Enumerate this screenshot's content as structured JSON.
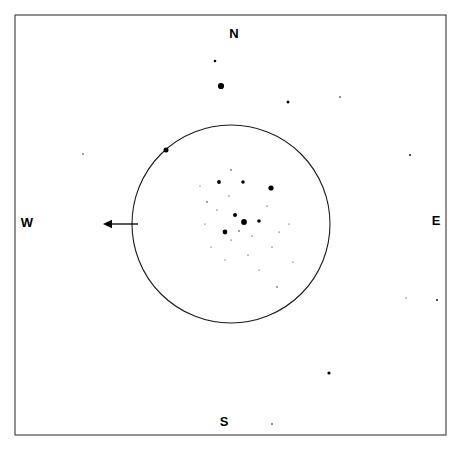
{
  "chart_data": {
    "type": "scatter",
    "title": "",
    "xlabel": "",
    "ylabel": "",
    "xlim": [
      0,
      461
    ],
    "ylim": [
      0,
      450
    ],
    "grid": false,
    "legend": null,
    "frame": {
      "x": 15,
      "y": 15,
      "width": 431,
      "height": 420,
      "stroke": "#3a3a3a"
    },
    "eyepiece_field": {
      "center_x": 231,
      "center_y": 224,
      "radius": 99,
      "stroke": "#1a1a1a"
    },
    "drift_arrow": {
      "tip_x": 103,
      "tip_y": 224,
      "tail_x": 138,
      "tail_y": 224,
      "direction": "west",
      "color": "#000000"
    },
    "cardinal_labels": [
      {
        "text": "N",
        "x": 234,
        "y": 35
      },
      {
        "text": "E",
        "x": 436,
        "y": 222
      },
      {
        "text": "S",
        "x": 224,
        "y": 423
      },
      {
        "text": "W",
        "x": 27,
        "y": 224
      }
    ],
    "star_color": "#000000",
    "stars": [
      {
        "x": 221,
        "y": 86,
        "r": 3.1,
        "region": "outside-north"
      },
      {
        "x": 215,
        "y": 61,
        "r": 1.3,
        "region": "outside-north"
      },
      {
        "x": 288,
        "y": 102,
        "r": 1.5,
        "region": "outside-northeast"
      },
      {
        "x": 340,
        "y": 97,
        "r": 0.8,
        "region": "outside-northeast"
      },
      {
        "x": 410,
        "y": 155,
        "r": 0.9,
        "region": "outside-east"
      },
      {
        "x": 437,
        "y": 300,
        "r": 0.9,
        "region": "outside-east"
      },
      {
        "x": 329,
        "y": 373,
        "r": 1.6,
        "region": "outside-south"
      },
      {
        "x": 272,
        "y": 424,
        "r": 0.8,
        "region": "outside-south"
      },
      {
        "x": 83,
        "y": 154,
        "r": 0.7,
        "region": "outside-west"
      },
      {
        "x": 406,
        "y": 298,
        "r": 0.6,
        "region": "outside-east"
      },
      {
        "x": 166,
        "y": 150,
        "r": 2.5,
        "region": "field-edge"
      },
      {
        "x": 219,
        "y": 182,
        "r": 1.9,
        "region": "cluster"
      },
      {
        "x": 243,
        "y": 182,
        "r": 1.8,
        "region": "cluster"
      },
      {
        "x": 271,
        "y": 188,
        "r": 2.6,
        "region": "cluster"
      },
      {
        "x": 235,
        "y": 215,
        "r": 2.0,
        "region": "cluster-core"
      },
      {
        "x": 244,
        "y": 222,
        "r": 2.9,
        "region": "cluster-core"
      },
      {
        "x": 259,
        "y": 221,
        "r": 1.8,
        "region": "cluster-core"
      },
      {
        "x": 225,
        "y": 232,
        "r": 2.4,
        "region": "cluster-core"
      },
      {
        "x": 231,
        "y": 170,
        "r": 0.7,
        "region": "cluster"
      },
      {
        "x": 207,
        "y": 202,
        "r": 0.7,
        "region": "cluster"
      },
      {
        "x": 229,
        "y": 196,
        "r": 0.6,
        "region": "cluster"
      },
      {
        "x": 217,
        "y": 210,
        "r": 0.6,
        "region": "cluster"
      },
      {
        "x": 239,
        "y": 231,
        "r": 0.7,
        "region": "cluster-core"
      },
      {
        "x": 231,
        "y": 240,
        "r": 0.6,
        "region": "cluster-core"
      },
      {
        "x": 252,
        "y": 236,
        "r": 0.6,
        "region": "cluster-core"
      },
      {
        "x": 267,
        "y": 206,
        "r": 0.6,
        "region": "cluster"
      },
      {
        "x": 205,
        "y": 224,
        "r": 0.5,
        "region": "cluster"
      },
      {
        "x": 248,
        "y": 255,
        "r": 0.6,
        "region": "cluster"
      },
      {
        "x": 272,
        "y": 247,
        "r": 0.6,
        "region": "cluster"
      },
      {
        "x": 279,
        "y": 232,
        "r": 0.6,
        "region": "cluster"
      },
      {
        "x": 289,
        "y": 224,
        "r": 0.5,
        "region": "cluster"
      },
      {
        "x": 277,
        "y": 287,
        "r": 0.7,
        "region": "cluster-outer"
      },
      {
        "x": 259,
        "y": 270,
        "r": 0.5,
        "region": "cluster-outer"
      },
      {
        "x": 293,
        "y": 262,
        "r": 0.5,
        "region": "cluster-outer"
      },
      {
        "x": 211,
        "y": 247,
        "r": 0.5,
        "region": "cluster"
      },
      {
        "x": 225,
        "y": 260,
        "r": 0.5,
        "region": "cluster"
      },
      {
        "x": 200,
        "y": 186,
        "r": 0.5,
        "region": "cluster"
      }
    ]
  }
}
